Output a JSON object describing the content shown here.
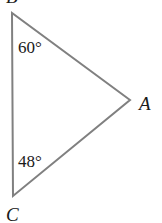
{
  "figure": {
    "type": "geometry-diagram",
    "shape": "triangle",
    "background_color": "#ffffff",
    "stroke_color": "#808080",
    "stroke_width": 2,
    "text_color": "#1a1a1a",
    "canvas": {
      "width": 162,
      "height": 223
    }
  },
  "vertices": [
    {
      "id": "B",
      "label": "B",
      "x": 12,
      "y": 13,
      "label_x": 6,
      "label_y": -13,
      "clipped": true
    },
    {
      "id": "C",
      "label": "C",
      "x": 13,
      "y": 196,
      "label_x": 6,
      "label_y": 205,
      "clipped": true
    },
    {
      "id": "A",
      "label": "A",
      "x": 130,
      "y": 100,
      "label_x": 139,
      "label_y": 94,
      "clipped": false
    }
  ],
  "edges": [
    {
      "from": "B",
      "to": "A"
    },
    {
      "from": "A",
      "to": "C"
    },
    {
      "from": "C",
      "to": "B"
    }
  ],
  "angles": [
    {
      "at_vertex": "B",
      "value": "60°",
      "label_x": 18,
      "label_y": 39
    },
    {
      "at_vertex": "C",
      "value": "48°",
      "label_x": 18,
      "label_y": 153
    }
  ],
  "polygon_points": "12,13 130,100 13,196"
}
